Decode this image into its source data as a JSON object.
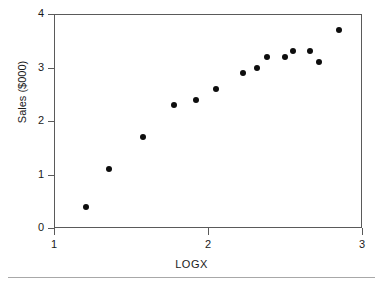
{
  "chart_data": {
    "type": "scatter",
    "title": "",
    "xlabel": "LOGX",
    "ylabel": "Sales ($000)",
    "xlim": [
      1,
      3
    ],
    "ylim": [
      0,
      4
    ],
    "xticks": [
      1,
      2,
      3
    ],
    "xtick_labels": [
      "1",
      "2",
      "3"
    ],
    "yticks": [
      0,
      1,
      2,
      3,
      4
    ],
    "ytick_labels": [
      "0",
      "1",
      "2",
      "3",
      "4"
    ],
    "grid": false,
    "legend": null,
    "marker": "filled-circle",
    "marker_color": "#0d0d0d",
    "frame_color": "#5a5a5a",
    "background": "#ffffff",
    "x": [
      1.21,
      1.36,
      1.58,
      1.78,
      1.92,
      2.05,
      2.23,
      2.32,
      2.38,
      2.5,
      2.55,
      2.66,
      2.72,
      2.85
    ],
    "y": [
      0.4,
      1.1,
      1.7,
      2.3,
      2.4,
      2.6,
      2.9,
      3.0,
      3.2,
      3.2,
      3.3,
      3.3,
      3.1,
      3.7
    ],
    "points": [
      {
        "x": 1.21,
        "y": 0.4
      },
      {
        "x": 1.36,
        "y": 1.1
      },
      {
        "x": 1.58,
        "y": 1.7
      },
      {
        "x": 1.78,
        "y": 2.3
      },
      {
        "x": 1.92,
        "y": 2.4
      },
      {
        "x": 2.05,
        "y": 2.6
      },
      {
        "x": 2.23,
        "y": 2.9
      },
      {
        "x": 2.32,
        "y": 3.0
      },
      {
        "x": 2.38,
        "y": 3.2
      },
      {
        "x": 2.5,
        "y": 3.2
      },
      {
        "x": 2.55,
        "y": 3.3
      },
      {
        "x": 2.66,
        "y": 3.3
      },
      {
        "x": 2.72,
        "y": 3.1
      },
      {
        "x": 2.85,
        "y": 3.7
      }
    ]
  }
}
